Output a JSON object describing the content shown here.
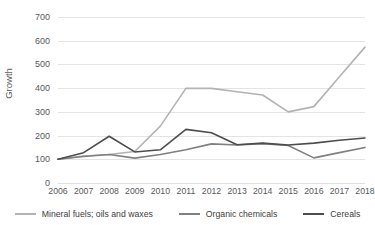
{
  "chart_data": {
    "type": "line",
    "title": "",
    "subtitle": "",
    "xlabel": "",
    "ylabel": "Growth",
    "categories": [
      "2006",
      "2007",
      "2008",
      "2009",
      "2010",
      "2011",
      "2012",
      "2013",
      "2014",
      "2015",
      "2016",
      "2017",
      "2018"
    ],
    "x": [
      2006,
      2007,
      2008,
      2009,
      2010,
      2011,
      2012,
      2013,
      2014,
      2015,
      2016,
      2017,
      2018
    ],
    "ylim": [
      0,
      700
    ],
    "y_ticks": [
      0,
      100,
      200,
      300,
      400,
      500,
      600,
      700
    ],
    "y_tick_labels": [
      "0",
      "100",
      "200",
      "300",
      "400",
      "500",
      "600",
      "700"
    ],
    "grid": true,
    "legend_position": "bottom",
    "series": [
      {
        "name": "Mineral fuels; oils and waxes",
        "color": "#b3b3b3",
        "values": [
          100,
          114,
          120,
          133,
          240,
          399,
          399,
          385,
          371,
          300,
          322,
          448,
          573
        ]
      },
      {
        "name": "Organic chemicals",
        "color": "#808080",
        "values": [
          100,
          112,
          120,
          105,
          120,
          140,
          165,
          160,
          166,
          158,
          106,
          128,
          150
        ]
      },
      {
        "name": "Cereals",
        "color": "#4d4d4d",
        "values": [
          100,
          128,
          197,
          131,
          140,
          226,
          212,
          161,
          168,
          160,
          168,
          180,
          190
        ]
      }
    ]
  },
  "axes": {
    "y_title": "Growth"
  },
  "legend": {
    "items": [
      {
        "label": "Mineral fuels; oils and waxes",
        "color": "#b3b3b3"
      },
      {
        "label": "Organic chemicals",
        "color": "#808080"
      },
      {
        "label": "Cereals",
        "color": "#4d4d4d"
      }
    ]
  }
}
